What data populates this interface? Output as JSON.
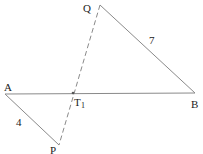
{
  "diagram": {
    "points": {
      "A": {
        "label": "A",
        "x": 5,
        "y": 94
      },
      "B": {
        "label": "B",
        "x": 195,
        "y": 93
      },
      "Q": {
        "label": "Q",
        "x": 100,
        "y": 5
      },
      "P": {
        "label": "P",
        "x": 59,
        "y": 145
      },
      "T1": {
        "label": "T",
        "subscript": "1",
        "x": 73,
        "y": 93
      }
    },
    "segments": [
      {
        "from": "A",
        "to": "B",
        "style": "solid"
      },
      {
        "from": "Q",
        "to": "B",
        "style": "solid",
        "length_label": "7"
      },
      {
        "from": "A",
        "to": "P",
        "style": "solid",
        "length_label": "4"
      },
      {
        "from": "Q",
        "to": "P",
        "style": "dashed"
      }
    ],
    "labels": {
      "A": "A",
      "B": "B",
      "Q": "Q",
      "P": "P",
      "T": "T",
      "T_sub": "1",
      "QB_length": "7",
      "AP_length": "4"
    },
    "colors": {
      "line": "#888888",
      "text": "#222222"
    }
  }
}
